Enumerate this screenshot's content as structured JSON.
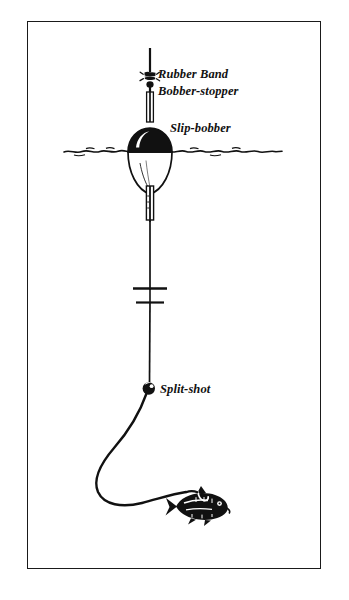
{
  "figure": {
    "background_color": "#ffffff",
    "ink_color": "#111111",
    "frame": {
      "border_color": "#1a1a1a",
      "border_width_px": 1.6,
      "x": 27,
      "y": 21,
      "width": 294,
      "height": 548
    }
  },
  "labels": {
    "rubber_band": "Rubber Band",
    "bobber_stopper": "Bobber-stopper",
    "slip_bobber": "Slip-bobber",
    "split_shot": "Split-shot"
  },
  "components": [
    {
      "id": "fishing-line",
      "name": "fishing-line",
      "description": "vertical monofilament line from top of frame down to split-shot"
    },
    {
      "id": "rubber-band-stopper",
      "name": "rubber-band-bobber-stopper-knot",
      "label": "Rubber Band",
      "label2": "Bobber-stopper",
      "x": 150,
      "y": 76
    },
    {
      "id": "slip-bobber",
      "name": "slip-bobber-float",
      "label": "Slip-bobber",
      "x": 150,
      "y": 152,
      "top_half_color": "#111111",
      "bottom_half_color": "#ffffff"
    },
    {
      "id": "waterline",
      "name": "waterline",
      "y": 152,
      "x_start": 64,
      "x_end": 282
    },
    {
      "id": "bead-stop",
      "name": "bead-stop",
      "x": 150,
      "y": 292
    },
    {
      "id": "split-shot",
      "name": "split-shot-sinker",
      "label": "Split-shot",
      "x": 149,
      "y": 388
    },
    {
      "id": "leader",
      "name": "leader-line",
      "description": "curved slack leader sweeping down-left then right to the bait"
    },
    {
      "id": "baitfish",
      "name": "baitfish-on-hook",
      "x": 200,
      "y": 505,
      "facing": "right"
    }
  ]
}
